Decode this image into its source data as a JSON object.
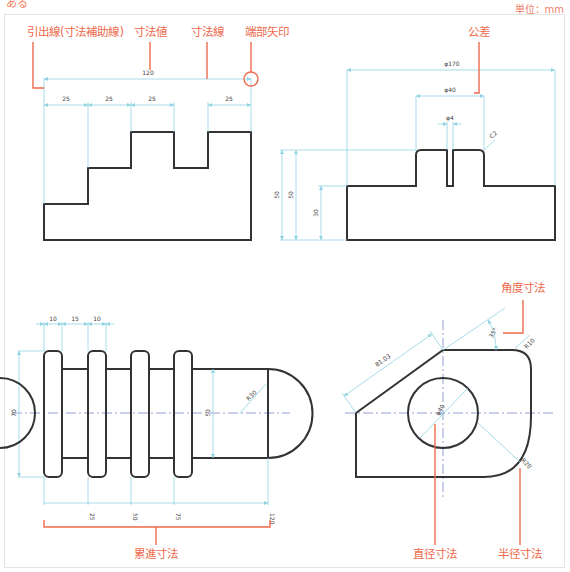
{
  "header": {
    "top_fragment": "ある",
    "unit_label": "単位：mm"
  },
  "callouts": {
    "extension_line": "引出線(寸法補助線)",
    "dimension_value": "寸法値",
    "dimension_line": "寸法線",
    "terminal_arrow": "端部矢印",
    "tolerance": "公差",
    "angular_dimension": "角度寸法",
    "cumulative_dimension": "累進寸法",
    "diameter_dimension": "直径寸法",
    "radius_dimension": "半径寸法"
  },
  "view1": {
    "overall": "120",
    "segments": [
      "25",
      "25",
      "25",
      "25"
    ]
  },
  "view2": {
    "overall": "φ170",
    "boss": "φ40",
    "slot": "φ4",
    "chamfer": "C2",
    "heights": [
      "50",
      "50",
      "30"
    ]
  },
  "view3": {
    "flanges": [
      "10",
      "15",
      "10"
    ],
    "outer_height": "70",
    "shaft_height": "50",
    "end_radius": "R30",
    "cumulative": [
      "25",
      "50",
      "75",
      "120"
    ]
  },
  "view4": {
    "slant_length": "81.03",
    "angle": "35°",
    "corner_radius_top": "R10",
    "hole_diameter": "φ40",
    "corner_radius_bottom": "R20"
  },
  "colors": {
    "callout": "#ee6a4c",
    "dimension_line": "#8fd3e3",
    "outline": "#333333",
    "centerline": "#7a88c8"
  }
}
